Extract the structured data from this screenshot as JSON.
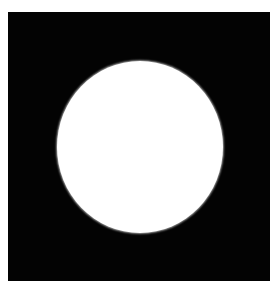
{
  "image": {
    "description": "White circle centered on a black square",
    "background_color": "#ffffff",
    "frame_color": "#030303",
    "shape_color": "#ffffff",
    "shape": "circle"
  }
}
